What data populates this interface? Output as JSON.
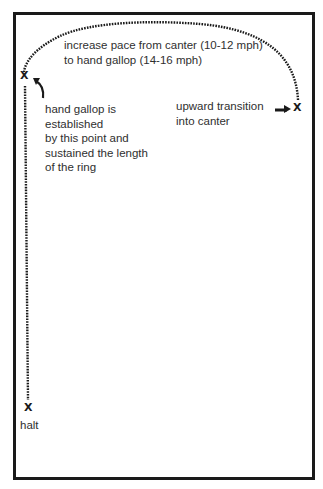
{
  "diagram": {
    "colors": {
      "stroke": "#1a1a1a",
      "text": "#2f2f2f",
      "background": "#ffffff"
    },
    "markers": {
      "start": "X",
      "gallop_established": "X",
      "halt": "X"
    },
    "labels": {
      "increase_pace_line1": "increase pace from canter (10-12 mph)",
      "increase_pace_line2": "to hand gallop (14-16 mph)",
      "gallop_line1": "hand gallop is",
      "gallop_line2": "established",
      "gallop_line3": "by this point and",
      "gallop_line4": "sustained the length",
      "gallop_line5": "of the ring",
      "transition_line1": "upward transition",
      "transition_line2": "into canter",
      "halt": "halt"
    },
    "icons": [
      "curved-arrow-icon",
      "pointing-arrow-icon"
    ]
  }
}
